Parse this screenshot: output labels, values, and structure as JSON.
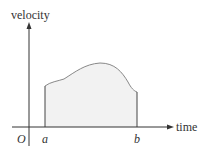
{
  "diagram": {
    "y_axis_label": "velocity",
    "x_axis_label": "time",
    "origin_label": "O",
    "lower_bound_label": "a",
    "upper_bound_label": "b",
    "colors": {
      "axis": "#333333",
      "curve": "#888888",
      "fill": "#f2f2f2",
      "bound_lines": "#444444"
    }
  }
}
